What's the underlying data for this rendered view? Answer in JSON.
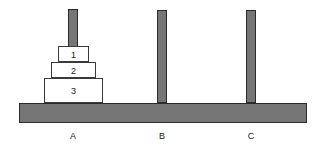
{
  "diagram": {
    "colors": {
      "background": "#ffffff",
      "peg_fill": "#767676",
      "peg_stroke": "#2b2b2b",
      "base_fill": "#767676",
      "base_stroke": "#2b2b2b",
      "disk_fill": "#ffffff",
      "disk_stroke": "#3a3a3a",
      "text": "#1a1a1a"
    },
    "base": {
      "name": "base-bar",
      "x": 19,
      "y": 103,
      "width": 288,
      "height": 20
    },
    "pegs": [
      {
        "id": "A",
        "label": "A",
        "x": 68,
        "y": 9,
        "width": 10,
        "height": 94,
        "label_x": 62,
        "label_y": 131
      },
      {
        "id": "B",
        "label": "B",
        "x": 157,
        "y": 10,
        "width": 10,
        "height": 93,
        "label_x": 151,
        "label_y": 131
      },
      {
        "id": "C",
        "label": "C",
        "x": 246,
        "y": 10,
        "width": 10,
        "height": 93,
        "label_x": 240,
        "label_y": 131
      }
    ],
    "disks": [
      {
        "label": "1",
        "size": 1,
        "on_peg": "A",
        "stack_position": 3,
        "x": 58,
        "y": 46,
        "width": 31,
        "height": 16
      },
      {
        "label": "2",
        "size": 2,
        "on_peg": "A",
        "stack_position": 2,
        "x": 51,
        "y": 62,
        "width": 45,
        "height": 16
      },
      {
        "label": "3",
        "size": 3,
        "on_peg": "A",
        "stack_position": 1,
        "x": 44,
        "y": 78,
        "width": 59,
        "height": 25
      }
    ]
  }
}
